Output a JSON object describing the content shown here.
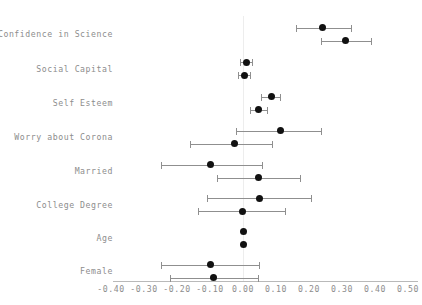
{
  "chart_data": {
    "type": "scatter",
    "subtype": "coefficient-plot",
    "title": "",
    "xlabel": "",
    "ylabel": "",
    "xlim": [
      -0.45,
      0.55
    ],
    "xticks": [
      -0.4,
      -0.3,
      -0.2,
      -0.1,
      0.0,
      0.1,
      0.2,
      0.3,
      0.4,
      0.5
    ],
    "xticklabels": [
      "-0.40",
      "-0.30",
      "-0.20",
      "-0.10",
      "0.00",
      "0.10",
      "0.20",
      "0.30",
      "0.40",
      "0.50"
    ],
    "categories": [
      "Confidence in Science",
      "Social Capital",
      "Self Esteem",
      "Worry about Corona",
      "Married",
      "College Degree",
      "Age",
      "Female"
    ],
    "grid": false,
    "zero_reference_line": 0.0,
    "legend": [],
    "legend_position": "none",
    "marker_color": "#111111",
    "whisker_color": "#8f8f8f",
    "axis_color": "#b9b9b9",
    "text_color": "#8d8d8d",
    "series": [
      {
        "name": "Model 1",
        "points": [
          {
            "category": "Confidence in Science",
            "estimate": 0.24,
            "low": 0.16,
            "high": 0.33
          },
          {
            "category": "Social Capital",
            "estimate": 0.01,
            "low": -0.01,
            "high": 0.03
          },
          {
            "category": "Self Esteem",
            "estimate": 0.085,
            "low": 0.055,
            "high": 0.115
          },
          {
            "category": "Worry about Corona",
            "estimate": 0.115,
            "low": -0.02,
            "high": 0.24
          },
          {
            "category": "Married",
            "estimate": -0.1,
            "low": -0.25,
            "high": 0.06
          },
          {
            "category": "College Degree",
            "estimate": 0.05,
            "low": -0.11,
            "high": 0.21
          },
          {
            "category": "Age",
            "estimate": 0.0,
            "low": 0.0,
            "high": 0.0
          },
          {
            "category": "Female",
            "estimate": -0.1,
            "low": -0.25,
            "high": 0.05
          }
        ]
      },
      {
        "name": "Model 2",
        "points": [
          {
            "category": "Confidence in Science",
            "estimate": 0.31,
            "low": 0.235,
            "high": 0.39
          },
          {
            "category": "Social Capital",
            "estimate": 0.005,
            "low": -0.015,
            "high": 0.025
          },
          {
            "category": "Self Esteem",
            "estimate": 0.048,
            "low": 0.02,
            "high": 0.075
          },
          {
            "category": "Worry about Corona",
            "estimate": -0.027,
            "low": -0.16,
            "high": 0.09
          },
          {
            "category": "Married",
            "estimate": 0.048,
            "low": -0.08,
            "high": 0.175
          },
          {
            "category": "College Degree",
            "estimate": 0.0,
            "low": -0.135,
            "high": 0.13
          },
          {
            "category": "Age",
            "estimate": 0.0,
            "low": 0.0,
            "high": 0.0
          },
          {
            "category": "Female",
            "estimate": -0.09,
            "low": -0.22,
            "high": 0.05
          }
        ]
      }
    ]
  }
}
